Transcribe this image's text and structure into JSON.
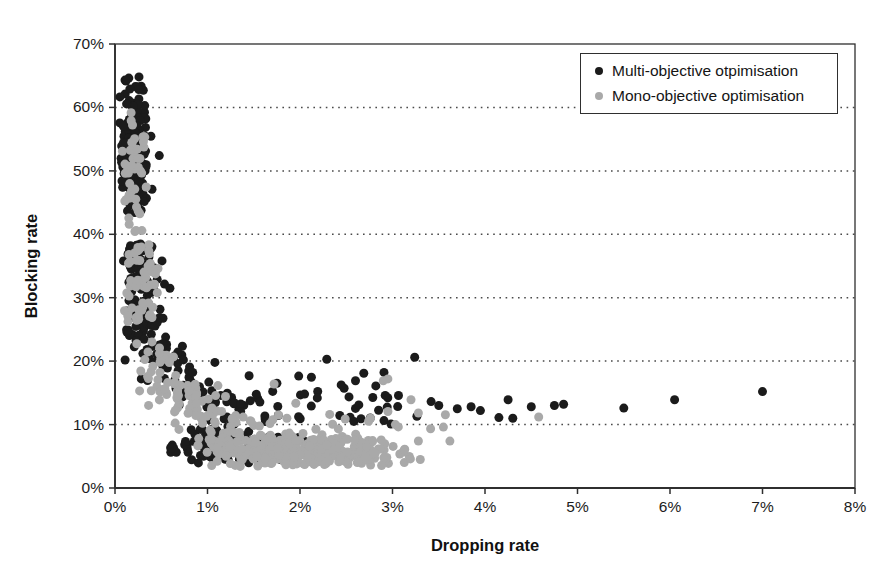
{
  "figure": {
    "width": 891,
    "height": 581,
    "background": "#ffffff"
  },
  "chart_data": {
    "type": "scatter",
    "title": "",
    "xlabel": "Dropping rate",
    "ylabel": "Blocking rate",
    "x_unit": "%",
    "y_unit": "%",
    "xlim": [
      0,
      8
    ],
    "ylim": [
      0,
      70
    ],
    "x_tick_labels": [
      "0%",
      "1%",
      "2%",
      "3%",
      "4%",
      "5%",
      "6%",
      "7%",
      "8%"
    ],
    "y_tick_labels": [
      "0%",
      "10%",
      "20%",
      "30%",
      "40%",
      "50%",
      "60%",
      "70%"
    ],
    "grid": {
      "horizontal": "dotted",
      "vertical": "none",
      "color": "#4a4a4a"
    },
    "axis_color": "#2f2f2f",
    "legend": {
      "position": "top-right",
      "border_color": "#2f2f2f",
      "background": "#ffffff"
    },
    "marker": {
      "shape": "circle",
      "diameter_px": 9
    },
    "series": [
      {
        "name": "Multi-objective otpimisation",
        "color": "#1b1b1b",
        "clusters": [
          {
            "label": "dense-vertical-band",
            "n": 175,
            "x": {
              "mean": 0.2,
              "sd": 0.08,
              "min": 0.05,
              "max": 0.5
            },
            "y": {
              "mean": 54,
              "sd": 5.2,
              "min": 43,
              "max": 65
            }
          },
          {
            "label": "upper-mid-band",
            "n": 40,
            "x": {
              "mean": 0.25,
              "sd": 0.09,
              "min": 0.08,
              "max": 0.55
            },
            "y": {
              "min": 34,
              "max": 38.5
            }
          },
          {
            "label": "mid-band",
            "n": 70,
            "x": {
              "mean": 0.3,
              "sd": 0.12,
              "min": 0.1,
              "max": 0.7
            },
            "y": {
              "min": 24,
              "max": 34
            }
          },
          {
            "label": "elbow",
            "n": 80,
            "path": {
              "x0": 0.3,
              "y0": 23,
              "x1": 1.35,
              "y1": 9.5,
              "x_jitter": 0.1,
              "y_jitter": 2.2
            }
          },
          {
            "label": "low-band",
            "n": 95,
            "x": {
              "mean": 1.2,
              "sd": 0.5,
              "min": 0.55,
              "max": 2.9
            },
            "y": {
              "mean": 6.5,
              "sd": 1.6,
              "min": 3.8,
              "max": 10.5
            }
          },
          {
            "label": "scatter-above-low-band",
            "n": 48,
            "x": {
              "min": 0.95,
              "max": 3.5
            },
            "y": {
              "mean": 13,
              "sd": 2.2,
              "min": 10,
              "max": 18.5
            }
          }
        ],
        "outlier_points": [
          [
            0.74,
            20.2
          ],
          [
            1.08,
            19.8
          ],
          [
            2.29,
            20.3
          ],
          [
            3.24,
            20.6
          ],
          [
            1.45,
            17.7
          ],
          [
            1.75,
            16.5
          ],
          [
            2.05,
            14.8
          ],
          [
            2.6,
            16.9
          ],
          [
            2.82,
            16.1
          ],
          [
            3.5,
            13.0
          ],
          [
            3.7,
            12.5
          ],
          [
            3.85,
            12.8
          ],
          [
            3.95,
            12.2
          ],
          [
            4.15,
            11.1
          ],
          [
            4.25,
            13.9
          ],
          [
            4.3,
            11.0
          ],
          [
            4.5,
            12.8
          ],
          [
            4.75,
            13.0
          ],
          [
            4.85,
            13.2
          ],
          [
            5.5,
            12.6
          ],
          [
            6.05,
            13.9
          ],
          [
            7.0,
            15.2
          ]
        ]
      },
      {
        "name": "Mono-objective optimisation",
        "color": "#a9a9a9",
        "clusters": [
          {
            "label": "vertical-band",
            "n": 48,
            "x": {
              "mean": 0.22,
              "sd": 0.08,
              "min": 0.08,
              "max": 0.5
            },
            "y": {
              "mean": 50,
              "sd": 5.5,
              "min": 40,
              "max": 62
            }
          },
          {
            "label": "mid-band",
            "n": 55,
            "x": {
              "mean": 0.28,
              "sd": 0.1,
              "min": 0.1,
              "max": 0.55
            },
            "y": {
              "min": 26,
              "max": 38.5
            }
          },
          {
            "label": "elbow",
            "n": 105,
            "path": {
              "x0": 0.35,
              "y0": 20,
              "x1": 1.25,
              "y1": 8,
              "x_jitter": 0.12,
              "y_jitter": 2.4
            }
          },
          {
            "label": "dense-low-blob",
            "n": 340,
            "x": {
              "mean": 2.0,
              "sd": 0.55,
              "min": 0.85,
              "max": 3.3
            },
            "y": {
              "mean": 5.8,
              "sd": 1.25,
              "min": 3.3,
              "max": 8.8
            }
          },
          {
            "label": "scatter-above-blob",
            "n": 26,
            "x": {
              "min": 1.1,
              "max": 3.6
            },
            "y": {
              "mean": 10.5,
              "sd": 1.6,
              "min": 8.8,
              "max": 14.5
            }
          }
        ],
        "outlier_points": [
          [
            1.72,
            16.4
          ],
          [
            2.9,
            16.9
          ],
          [
            2.95,
            17.2
          ],
          [
            3.2,
            13.9
          ],
          [
            3.55,
            9.6
          ],
          [
            3.62,
            7.4
          ],
          [
            3.3,
            4.5
          ],
          [
            4.58,
            11.2
          ]
        ]
      }
    ]
  }
}
